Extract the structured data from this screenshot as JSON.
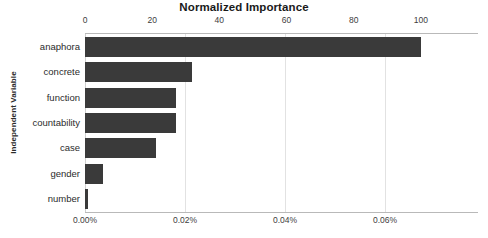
{
  "chart_data": {
    "type": "bar",
    "orientation": "horizontal",
    "title": "Normalized Importance",
    "xlabel": "",
    "ylabel": "Independent Variable",
    "categories": [
      "anaphora",
      "concrete",
      "function",
      "countability",
      "case",
      "gender",
      "number"
    ],
    "values": [
      100,
      32,
      27,
      27,
      21,
      5.5,
      1
    ],
    "series": [
      {
        "name": "Normalized Importance",
        "values": [
          100,
          32,
          27,
          27,
          21,
          5.5,
          1
        ]
      }
    ],
    "secondary_values_percent": [
      0.067,
      0.0214,
      0.0181,
      0.0181,
      0.0141,
      0.0037,
      0.0007
    ],
    "top_axis": {
      "label": "Normalized Importance",
      "ticks": [
        0,
        20,
        40,
        60,
        80,
        100
      ],
      "tick_labels": [
        "0",
        "20",
        "40",
        "60",
        "80",
        "100"
      ],
      "lim": [
        0,
        117
      ]
    },
    "bottom_axis": {
      "label": "",
      "ticks": [
        0.0,
        0.02,
        0.04,
        0.06
      ],
      "tick_labels": [
        "0.00%",
        "0.02%",
        "0.04%",
        "0.06%"
      ],
      "lim": [
        0.0,
        0.0786
      ]
    },
    "grid": true,
    "grid_axis": "x",
    "legend": "none",
    "bar_color": "#3a3a3a",
    "background_color": "#ffffff",
    "axis_color": "#b9b9b9",
    "gridline_color": "#e2e2e2"
  },
  "layout": {
    "plot_left_px": 85,
    "plot_top_px": 34,
    "plot_width_px": 393,
    "plot_height_px": 178,
    "unit_px_per_value": 3.35
  }
}
